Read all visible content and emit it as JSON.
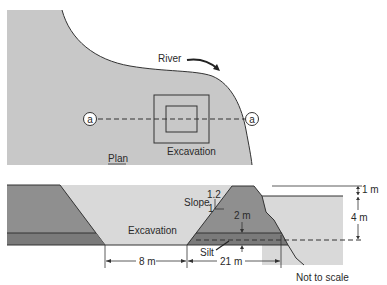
{
  "plan": {
    "title": "Plan",
    "river_label": "River",
    "excavation_label": "Excavation",
    "section_marker_left": "a",
    "section_marker_right": "a"
  },
  "section": {
    "excavation_label": "Excavation",
    "slope_label": "Slope",
    "slope_rise": "1.2",
    "slope_run": "1",
    "silt_label": "Silt",
    "dim_bottom_width": "8 m",
    "dim_dike_base": "21 m",
    "dim_silt_depth": "2 m",
    "dim_freeboard": "1 m",
    "dim_water_depth": "4 m",
    "note": "Not to scale"
  },
  "colors": {
    "land": "#c8c8c8",
    "excavation": "#d9d9d9",
    "fill_dark": "#8f8f8f",
    "silt": "#7a7a7a",
    "line": "#333333"
  }
}
